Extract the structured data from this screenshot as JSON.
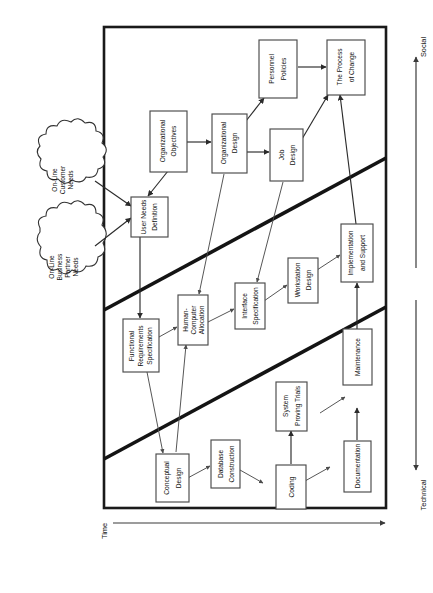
{
  "figure": {
    "orientation": "rotated-90-ccw",
    "frame_stroke": "#1a1a1a",
    "background": "#ffffff"
  },
  "axes": {
    "time": {
      "label": "Time",
      "direction": "right"
    },
    "social": {
      "label": "Social",
      "direction": "up"
    },
    "technical": {
      "label": "Technical",
      "direction": "down"
    }
  },
  "bands": {
    "count": 3,
    "names": [
      "Social",
      "Socio-Technical",
      "Technical"
    ]
  },
  "clouds": [
    {
      "id": "cloud-customer",
      "lines": [
        "On-Line",
        "Customer",
        "Needs"
      ]
    },
    {
      "id": "cloud-partner",
      "lines": [
        "On-Line",
        "Business",
        "Partner",
        "Needs"
      ]
    }
  ],
  "nodes": [
    {
      "id": "user-needs-definition",
      "lines": [
        "User Needs",
        "Definition"
      ]
    },
    {
      "id": "organizational-objectives",
      "lines": [
        "Organizational",
        "Objectives"
      ]
    },
    {
      "id": "organizational-design",
      "lines": [
        "Organizational",
        "Design"
      ]
    },
    {
      "id": "personnel-policies",
      "lines": [
        "Personnel",
        "Policies"
      ]
    },
    {
      "id": "job-design",
      "lines": [
        "Job",
        "Design"
      ]
    },
    {
      "id": "the-process-of-change",
      "lines": [
        "The Process",
        "of Change"
      ]
    },
    {
      "id": "functional-requirements-specification",
      "lines": [
        "Functional",
        "Requirements",
        "Specification"
      ]
    },
    {
      "id": "human-computer-allocation",
      "lines": [
        "Human-",
        "Computer",
        "Allocation"
      ]
    },
    {
      "id": "interface-specification",
      "lines": [
        "Interface",
        "Specification"
      ]
    },
    {
      "id": "workstation-design",
      "lines": [
        "Workstation",
        "Design"
      ]
    },
    {
      "id": "implementation-and-support",
      "lines": [
        "Implementation",
        "and Support"
      ]
    },
    {
      "id": "conceptual-design",
      "lines": [
        "Conceptual",
        "Design"
      ]
    },
    {
      "id": "database-construction",
      "lines": [
        "Database",
        "Construction"
      ]
    },
    {
      "id": "coding",
      "lines": [
        "Coding"
      ]
    },
    {
      "id": "system-proving-trials",
      "lines": [
        "System",
        "Proving Trials"
      ]
    },
    {
      "id": "documentation",
      "lines": [
        "Documentation"
      ]
    },
    {
      "id": "maintenance",
      "lines": [
        "Maintenance"
      ]
    }
  ],
  "edges": [
    {
      "from": "cloud-customer",
      "to": "user-needs-definition"
    },
    {
      "from": "cloud-partner",
      "to": "user-needs-definition"
    },
    {
      "from": "organizational-objectives",
      "to": "user-needs-definition"
    },
    {
      "from": "organizational-objectives",
      "to": "organizational-design"
    },
    {
      "from": "organizational-design",
      "to": "personnel-policies"
    },
    {
      "from": "organizational-design",
      "to": "job-design"
    },
    {
      "from": "organizational-design",
      "to": "human-computer-allocation"
    },
    {
      "from": "personnel-policies",
      "to": "the-process-of-change"
    },
    {
      "from": "job-design",
      "to": "the-process-of-change"
    },
    {
      "from": "job-design",
      "to": "interface-specification"
    },
    {
      "from": "user-needs-definition",
      "to": "functional-requirements-specification"
    },
    {
      "from": "functional-requirements-specification",
      "to": "human-computer-allocation"
    },
    {
      "from": "functional-requirements-specification",
      "to": "conceptual-design"
    },
    {
      "from": "conceptual-design",
      "to": "human-computer-allocation"
    },
    {
      "from": "human-computer-allocation",
      "to": "interface-specification"
    },
    {
      "from": "interface-specification",
      "to": "workstation-design"
    },
    {
      "from": "workstation-design",
      "to": "implementation-and-support"
    },
    {
      "from": "implementation-and-support",
      "to": "the-process-of-change"
    },
    {
      "from": "conceptual-design",
      "to": "database-construction"
    },
    {
      "from": "database-construction",
      "to": "coding"
    },
    {
      "from": "coding",
      "to": "system-proving-trials"
    },
    {
      "from": "coding",
      "to": "documentation"
    },
    {
      "from": "system-proving-trials",
      "to": "maintenance"
    },
    {
      "from": "documentation",
      "to": "maintenance"
    },
    {
      "from": "maintenance",
      "to": "implementation-and-support"
    }
  ]
}
